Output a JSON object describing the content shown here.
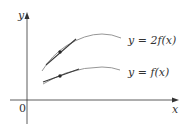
{
  "figure": {
    "axes": {
      "x_label": "x",
      "y_label": "y",
      "origin_label": "0"
    },
    "curves": [
      {
        "name": "upper",
        "label": "y = 2f(x)",
        "has_tangent_point": true
      },
      {
        "name": "lower",
        "label": "y = f(x)",
        "has_tangent_point": true
      }
    ],
    "colors": {
      "axis": "#333333",
      "curve": "#8a8a8a",
      "tangent": "#3a3a3a",
      "point": "#2a2a2a",
      "text": "#333333"
    }
  }
}
